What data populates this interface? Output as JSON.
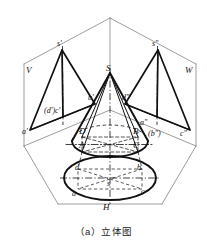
{
  "figure": {
    "caption": "（a）立体图",
    "description_labels": {
      "projection_planes": [
        {
          "id": "V",
          "label": "V"
        },
        {
          "id": "W",
          "label": "W"
        },
        {
          "id": "H",
          "label": "H"
        }
      ]
    }
  },
  "labels": {
    "plane_v": "V",
    "plane_w": "W",
    "plane_h": "H",
    "apex_front": "s'",
    "apex_side": "s\"",
    "apex_space": "S",
    "apex_top": "s",
    "front_a": "a'",
    "front_b": "b'",
    "front_dc": "(d')c'",
    "side_a": "a\"",
    "side_b": "(b\")",
    "side_c": "c\"",
    "side_d": "d\"",
    "space_A": "A",
    "space_B": "B",
    "space_C": "C",
    "space_D": "D",
    "top_a": "a",
    "top_b": "b",
    "top_c": "c",
    "top_d": "d"
  },
  "colors": {
    "ink": "#111111",
    "thin": "#555555",
    "background": "#ffffff"
  }
}
